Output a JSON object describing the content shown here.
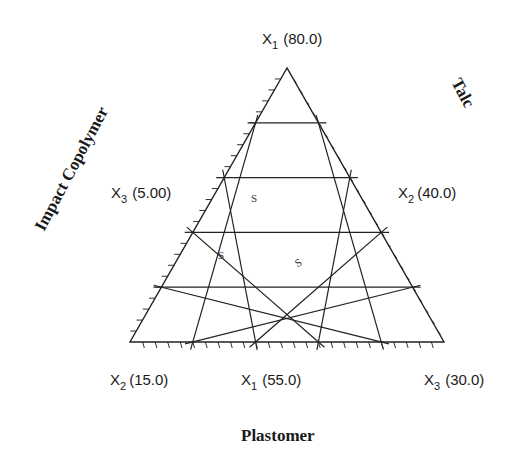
{
  "diagram": {
    "type": "ternary-mixture-design",
    "vertices": {
      "top": {
        "label": "X",
        "sub": "1",
        "value": "(80.0)"
      },
      "left_mid": {
        "label": "X",
        "sub": "3",
        "value": "(5.00)"
      },
      "right_mid": {
        "label": "X",
        "sub": "2",
        "value": "(40.0)"
      },
      "bottom_left": {
        "label": "X",
        "sub": "2",
        "value": "(15.0)"
      },
      "bottom_mid": {
        "label": "X",
        "sub": "1",
        "value": "(55.0)"
      },
      "bottom_right": {
        "label": "X",
        "sub": "3",
        "value": "(30.0)"
      }
    },
    "components": {
      "left": "Impact Copolymer",
      "right": "Talc",
      "bottom": "Plastomer"
    },
    "grid_divisions": 5,
    "markers": [
      {
        "text": "S"
      },
      {
        "text": "S"
      },
      {
        "text": "S"
      }
    ],
    "colors": {
      "line": "#222222",
      "text": "#1a1a1a",
      "background": "#ffffff"
    }
  }
}
